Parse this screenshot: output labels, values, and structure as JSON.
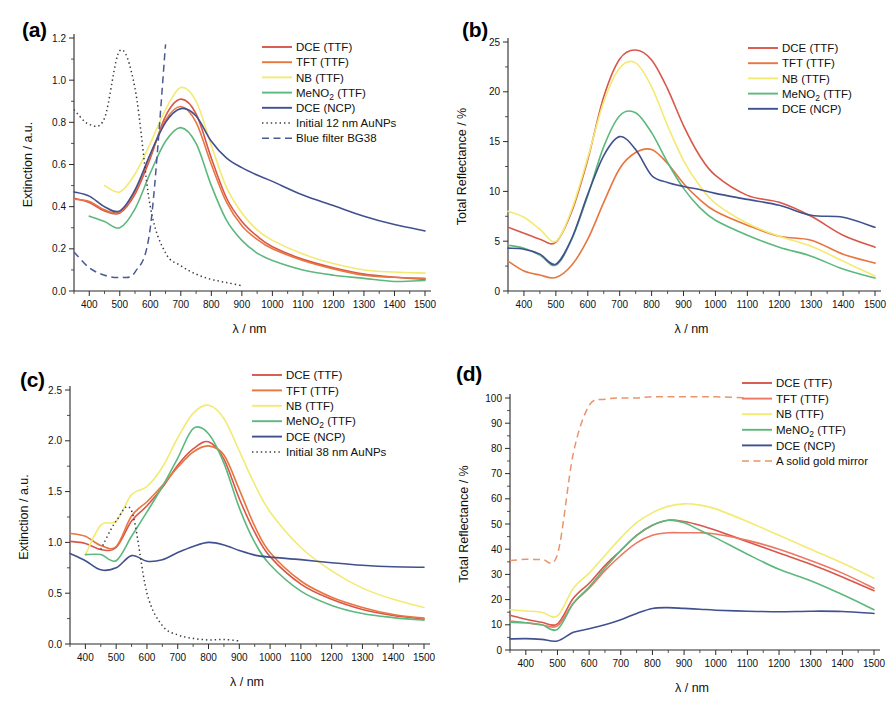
{
  "figure": {
    "panels": [
      "a",
      "b",
      "c",
      "d"
    ]
  },
  "panel_a": {
    "tag": "(a)",
    "legend": [
      {
        "label": "DCE (TTF)",
        "color": "#d9574a",
        "style": "solid"
      },
      {
        "label": "TFT (TTF)",
        "color": "#e8763f",
        "style": "solid"
      },
      {
        "label": "NB (TTF)",
        "color": "#f3ea72",
        "style": "solid"
      },
      {
        "label": "MeNO2 (TTF)",
        "color": "#5db87e",
        "style": "solid",
        "subscript": "2"
      },
      {
        "label": "DCE (NCP)",
        "color": "#41508f",
        "style": "solid"
      },
      {
        "label": "Initial 12 nm AuNPs",
        "color": "#3a3a3a",
        "style": "dotted"
      },
      {
        "label": "Blue filter BG38",
        "color": "#4a5a93",
        "style": "dashed"
      }
    ]
  },
  "panel_b": {
    "tag": "(b)",
    "legend": [
      {
        "label": "DCE (TTF)",
        "color": "#d9574a",
        "style": "solid"
      },
      {
        "label": "TFT (TTF)",
        "color": "#e8763f",
        "style": "solid"
      },
      {
        "label": "NB (TTF)",
        "color": "#f3ea72",
        "style": "solid"
      },
      {
        "label": "MeNO2 (TTF)",
        "color": "#5db87e",
        "style": "solid",
        "subscript": "2"
      },
      {
        "label": "DCE (NCP)",
        "color": "#41508f",
        "style": "solid"
      }
    ]
  },
  "panel_c": {
    "tag": "(c)",
    "legend": [
      {
        "label": "DCE (TTF)",
        "color": "#d9574a",
        "style": "solid"
      },
      {
        "label": "TFT (TTF)",
        "color": "#e8763f",
        "style": "solid"
      },
      {
        "label": "NB (TTF)",
        "color": "#f3ea72",
        "style": "solid"
      },
      {
        "label": "MeNO2 (TTF)",
        "color": "#5db87e",
        "style": "solid",
        "subscript": "2"
      },
      {
        "label": "DCE (NCP)",
        "color": "#41508f",
        "style": "solid"
      },
      {
        "label": "Initial 38 nm AuNPs",
        "color": "#3a3a3a",
        "style": "dotted"
      }
    ]
  },
  "panel_d": {
    "tag": "(d)",
    "legend": [
      {
        "label": "DCE (TTF)",
        "color": "#d9574a",
        "style": "solid"
      },
      {
        "label": "TFT (TTF)",
        "color": "#ef7663",
        "style": "solid"
      },
      {
        "label": "NB (TTF)",
        "color": "#f3ea72",
        "style": "solid"
      },
      {
        "label": "MeNO2 (TTF)",
        "color": "#5db87e",
        "style": "solid",
        "subscript": "2"
      },
      {
        "label": "DCE (NCP)",
        "color": "#41508f",
        "style": "solid"
      },
      {
        "label": "A solid gold mirror",
        "color": "#e8956a",
        "style": "dashed"
      }
    ]
  },
  "chart_data": [
    {
      "panel": "a",
      "type": "line",
      "title": "(a)",
      "xlabel": "λ / nm",
      "ylabel": "Extinction / a.u.",
      "xlim": [
        350,
        1500
      ],
      "ylim": [
        0.0,
        1.2
      ],
      "xticks": [
        400,
        500,
        600,
        700,
        800,
        900,
        1000,
        1100,
        1200,
        1300,
        1400,
        1500
      ],
      "yticks": [
        0.0,
        0.2,
        0.4,
        0.6,
        0.8,
        1.0,
        1.2
      ],
      "grid": false,
      "legend_position": "upper-right",
      "x": [
        350,
        400,
        450,
        500,
        550,
        600,
        650,
        700,
        750,
        800,
        850,
        900,
        950,
        1000,
        1100,
        1200,
        1300,
        1400,
        1500
      ],
      "series": [
        {
          "name": "DCE (TTF)",
          "color": "#d9574a",
          "style": "solid",
          "values": [
            0.44,
            0.42,
            0.38,
            0.37,
            0.46,
            0.63,
            0.83,
            0.91,
            0.84,
            0.63,
            0.44,
            0.33,
            0.26,
            0.21,
            0.15,
            0.11,
            0.08,
            0.065,
            0.055
          ]
        },
        {
          "name": "TFT (TTF)",
          "color": "#e8763f",
          "style": "solid",
          "values": [
            0.435,
            0.425,
            0.385,
            0.375,
            0.47,
            0.645,
            0.81,
            0.875,
            0.8,
            0.6,
            0.42,
            0.31,
            0.245,
            0.2,
            0.145,
            0.105,
            0.075,
            0.065,
            0.06
          ]
        },
        {
          "name": "NB (TTF)",
          "color": "#f3ea72",
          "style": "solid",
          "values": [
            null,
            null,
            0.5,
            0.47,
            0.555,
            0.7,
            0.86,
            0.965,
            0.9,
            0.69,
            0.49,
            0.37,
            0.29,
            0.24,
            0.175,
            0.13,
            0.1,
            0.09,
            0.085
          ]
        },
        {
          "name": "MeNO2 (TTF)",
          "color": "#5db87e",
          "style": "solid",
          "values": [
            null,
            0.355,
            0.33,
            0.3,
            0.39,
            0.56,
            0.71,
            0.775,
            0.7,
            0.5,
            0.335,
            0.24,
            0.18,
            0.145,
            0.1,
            0.075,
            0.06,
            0.045,
            0.05
          ]
        },
        {
          "name": "DCE (NCP)",
          "color": "#41508f",
          "style": "solid",
          "values": [
            0.47,
            0.45,
            0.4,
            0.38,
            0.48,
            0.65,
            0.8,
            0.865,
            0.83,
            0.71,
            0.63,
            0.585,
            0.55,
            0.52,
            0.455,
            0.405,
            0.355,
            0.315,
            0.285
          ]
        },
        {
          "name": "Initial 12 nm AuNPs",
          "color": "#3a3a3a",
          "style": "dotted",
          "values": [
            0.86,
            0.79,
            0.82,
            1.14,
            0.96,
            0.4,
            0.18,
            0.12,
            0.08,
            0.055,
            0.04,
            0.025,
            null,
            null,
            null,
            null,
            null,
            null,
            null
          ]
        },
        {
          "name": "Blue filter BG38",
          "color": "#4a5a93",
          "style": "dashed",
          "values": [
            0.185,
            0.11,
            0.075,
            0.065,
            0.09,
            0.3,
            1.17,
            null,
            null,
            null,
            null,
            null,
            null,
            null,
            null,
            null,
            null,
            null,
            null
          ]
        }
      ]
    },
    {
      "panel": "b",
      "type": "line",
      "title": "(b)",
      "xlabel": "λ / nm",
      "ylabel": "Total Reflectance / %",
      "xlim": [
        350,
        1500
      ],
      "ylim": [
        0,
        25
      ],
      "xticks": [
        400,
        500,
        600,
        700,
        800,
        900,
        1000,
        1100,
        1200,
        1300,
        1400,
        1500
      ],
      "yticks": [
        0,
        5,
        10,
        15,
        20,
        25
      ],
      "grid": false,
      "legend_position": "upper-right",
      "x": [
        350,
        400,
        450,
        500,
        550,
        600,
        650,
        700,
        750,
        800,
        850,
        900,
        950,
        1000,
        1100,
        1200,
        1300,
        1400,
        1500
      ],
      "series": [
        {
          "name": "DCE (TTF)",
          "color": "#d9574a",
          "style": "solid",
          "values": [
            6.4,
            5.8,
            5.2,
            4.9,
            8.0,
            13.2,
            19.5,
            23.3,
            24.2,
            23.2,
            20.3,
            16.6,
            13.6,
            11.6,
            9.6,
            8.9,
            7.5,
            5.6,
            4.4
          ]
        },
        {
          "name": "TFT (TTF)",
          "color": "#e8763f",
          "style": "solid",
          "values": [
            3.0,
            2.0,
            1.6,
            1.35,
            2.6,
            5.2,
            8.9,
            12.3,
            13.9,
            14.2,
            12.8,
            10.8,
            9.2,
            8.0,
            6.6,
            5.5,
            5.1,
            3.7,
            2.8
          ]
        },
        {
          "name": "NB (TTF)",
          "color": "#f3ea72",
          "style": "solid",
          "values": [
            8.0,
            7.4,
            6.2,
            5.0,
            8.2,
            13.4,
            19.0,
            22.4,
            22.9,
            20.5,
            16.6,
            13.1,
            10.6,
            8.8,
            6.8,
            5.5,
            4.5,
            3.0,
            1.5
          ]
        },
        {
          "name": "MeNO2 (TTF)",
          "color": "#5db87e",
          "style": "solid",
          "values": [
            4.6,
            4.3,
            3.6,
            2.6,
            5.2,
            9.6,
            14.5,
            17.6,
            17.9,
            15.9,
            12.9,
            10.3,
            8.4,
            7.1,
            5.6,
            4.4,
            3.5,
            2.2,
            1.3
          ]
        },
        {
          "name": "DCE (NCP)",
          "color": "#41508f",
          "style": "solid",
          "values": [
            4.3,
            4.2,
            3.7,
            2.7,
            5.3,
            9.7,
            13.6,
            15.5,
            14.2,
            11.6,
            10.9,
            10.5,
            10.2,
            9.8,
            9.2,
            8.6,
            7.6,
            7.4,
            6.4
          ]
        }
      ]
    },
    {
      "panel": "c",
      "type": "line",
      "title": "(c)",
      "xlabel": "λ / nm",
      "ylabel": "Extinction / a.u.",
      "xlim": [
        350,
        1500
      ],
      "ylim": [
        0.0,
        2.5
      ],
      "xticks": [
        400,
        500,
        600,
        700,
        800,
        900,
        1000,
        1100,
        1200,
        1300,
        1400,
        1500
      ],
      "yticks": [
        0.0,
        0.5,
        1.0,
        1.5,
        2.0,
        2.5
      ],
      "grid": false,
      "legend_position": "upper-right",
      "x": [
        350,
        400,
        450,
        500,
        550,
        600,
        650,
        700,
        750,
        800,
        850,
        900,
        950,
        1000,
        1100,
        1200,
        1300,
        1400,
        1500
      ],
      "series": [
        {
          "name": "DCE (TTF)",
          "color": "#d9574a",
          "style": "solid",
          "values": [
            1.01,
            0.99,
            0.93,
            0.95,
            1.21,
            1.36,
            1.54,
            1.76,
            1.92,
            1.99,
            1.82,
            1.43,
            1.1,
            0.86,
            0.59,
            0.44,
            0.34,
            0.28,
            0.245
          ]
        },
        {
          "name": "TFT (TTF)",
          "color": "#e8763f",
          "style": "solid",
          "values": [
            1.09,
            1.06,
            0.97,
            0.96,
            1.26,
            1.4,
            1.56,
            1.74,
            1.89,
            1.95,
            1.86,
            1.52,
            1.16,
            0.9,
            0.62,
            0.46,
            0.36,
            0.29,
            0.255
          ]
        },
        {
          "name": "NB (TTF)",
          "color": "#f3ea72",
          "style": "solid",
          "values": [
            null,
            0.88,
            1.17,
            1.21,
            1.47,
            1.55,
            1.74,
            2.03,
            2.27,
            2.35,
            2.22,
            1.9,
            1.57,
            1.3,
            0.95,
            0.72,
            0.55,
            0.44,
            0.36
          ]
        },
        {
          "name": "MeNO2 (TTF)",
          "color": "#5db87e",
          "style": "solid",
          "values": [
            null,
            0.88,
            0.88,
            0.82,
            1.06,
            1.3,
            1.55,
            1.83,
            2.12,
            2.07,
            1.78,
            1.34,
            1.0,
            0.78,
            0.52,
            0.38,
            0.3,
            0.26,
            0.235
          ]
        },
        {
          "name": "DCE (NCP)",
          "color": "#41508f",
          "style": "solid",
          "values": [
            0.89,
            0.82,
            0.73,
            0.75,
            0.87,
            0.815,
            0.83,
            0.9,
            0.96,
            1.0,
            0.975,
            0.92,
            0.875,
            0.855,
            0.83,
            0.8,
            0.775,
            0.76,
            0.755
          ]
        },
        {
          "name": "Initial 38 nm AuNPs",
          "color": "#3a3a3a",
          "style": "dotted",
          "values": [
            null,
            null,
            0.93,
            1.21,
            1.31,
            0.5,
            0.18,
            0.09,
            0.055,
            0.04,
            0.045,
            0.03,
            null,
            null,
            null,
            null,
            null,
            null,
            null
          ]
        }
      ]
    },
    {
      "panel": "d",
      "type": "line",
      "title": "(d)",
      "xlabel": "λ / nm",
      "ylabel": "Total Reflectance / %",
      "xlim": [
        350,
        1500
      ],
      "ylim": [
        0,
        100
      ],
      "xticks": [
        400,
        500,
        600,
        700,
        800,
        900,
        1000,
        1100,
        1200,
        1300,
        1400,
        1500
      ],
      "yticks": [
        0,
        10,
        20,
        30,
        40,
        50,
        60,
        70,
        80,
        90,
        100
      ],
      "grid": false,
      "legend_position": "upper-right",
      "x": [
        350,
        400,
        450,
        500,
        550,
        600,
        650,
        700,
        750,
        800,
        850,
        900,
        950,
        1000,
        1100,
        1200,
        1300,
        1400,
        1500
      ],
      "series": [
        {
          "name": "DCE (TTF)",
          "color": "#d9574a",
          "style": "solid",
          "values": [
            13.8,
            12.2,
            11.0,
            10.4,
            20.5,
            26.5,
            33.5,
            39.5,
            45.5,
            49.5,
            51.5,
            51.0,
            49.5,
            47.5,
            43.0,
            38.5,
            34.0,
            29.0,
            23.5
          ]
        },
        {
          "name": "TFT (TTF)",
          "color": "#ef7663",
          "style": "solid",
          "values": [
            11.5,
            10.8,
            10.0,
            9.6,
            18.5,
            24.5,
            31.5,
            37.5,
            42.5,
            45.5,
            46.5,
            46.5,
            46.5,
            46.0,
            43.5,
            40.0,
            35.5,
            30.5,
            24.5
          ]
        },
        {
          "name": "NB (TTF)",
          "color": "#f3ea72",
          "style": "solid",
          "values": [
            16.0,
            15.5,
            15.0,
            13.5,
            24.5,
            30.5,
            37.5,
            44.5,
            50.5,
            54.5,
            57.0,
            58.0,
            57.5,
            56.0,
            51.0,
            45.5,
            40.0,
            34.5,
            28.5
          ]
        },
        {
          "name": "MeNO2 (TTF)",
          "color": "#5db87e",
          "style": "solid",
          "values": [
            11.0,
            10.8,
            10.0,
            8.2,
            18.5,
            25.0,
            32.5,
            39.5,
            45.5,
            49.5,
            51.5,
            50.5,
            47.5,
            44.5,
            38.0,
            32.0,
            27.5,
            22.0,
            16.0
          ]
        },
        {
          "name": "DCE (NCP)",
          "color": "#41508f",
          "style": "solid",
          "values": [
            4.4,
            4.5,
            4.2,
            3.6,
            7.0,
            8.4,
            10.0,
            12.0,
            14.5,
            16.5,
            16.8,
            16.5,
            16.2,
            15.8,
            15.4,
            15.2,
            15.4,
            15.3,
            14.5
          ]
        },
        {
          "name": "A solid gold mirror",
          "color": "#e8956a",
          "style": "dashed",
          "values": [
            35.5,
            36.0,
            36.0,
            38.0,
            78.0,
            97.0,
            99.5,
            100.0,
            100.0,
            100.5,
            100.5,
            100.5,
            100.5,
            100.5,
            100.0,
            null,
            null,
            null,
            null
          ]
        }
      ]
    }
  ]
}
